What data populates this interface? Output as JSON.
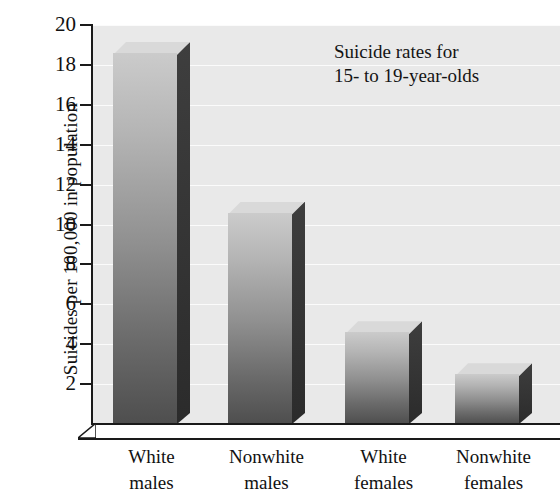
{
  "chart_data": {
    "type": "bar",
    "title": "",
    "annotation": "Suicide rates for\n15- to 19-year-olds",
    "categories": [
      "White\nmales",
      "Nonwhite\nmales",
      "White\nfemales",
      "Nonwhite\nfemales"
    ],
    "category_lines": [
      [
        "White",
        "males"
      ],
      [
        "Nonwhite",
        "males"
      ],
      [
        "White",
        "females"
      ],
      [
        "Nonwhite",
        "females"
      ]
    ],
    "values": [
      18.6,
      10.6,
      4.6,
      2.5
    ],
    "xlabel": "",
    "ylabel": "Suicides per 100,000 in population",
    "ylim": [
      0,
      20
    ],
    "ytick_values": [
      2,
      4,
      6,
      8,
      10,
      12,
      14,
      16,
      18,
      20
    ],
    "ytick_labels": [
      "2",
      "4",
      "6",
      "8",
      "10",
      "12",
      "14",
      "16",
      "18",
      "20"
    ],
    "grid": true,
    "grid_axis": "y",
    "legend": false,
    "style": "3d-bar",
    "colors": {
      "plot_background": "#e9e9e9",
      "figure_background": "#ffffff",
      "bar_top_gradient": "#cbcbcb",
      "bar_bottom_gradient": "#4e4e4e",
      "bar_side_face": "#343434",
      "axis": "#1a1a1a",
      "gridline": "#ffffff",
      "text": "#111111"
    }
  },
  "axis": {
    "y_title": "Suicides per 100,000 in population"
  },
  "annotation": {
    "line1": "Suicide rates for",
    "line2": "15- to 19-year-olds"
  }
}
